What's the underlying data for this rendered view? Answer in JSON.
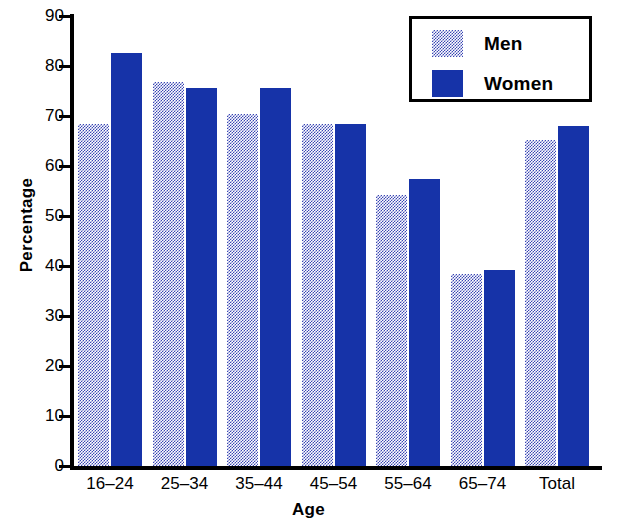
{
  "chart_data": {
    "type": "bar",
    "title": "",
    "xlabel": "Age",
    "ylabel": "Percentage",
    "categories": [
      "16–24",
      "25–34",
      "35–44",
      "45–54",
      "55–64",
      "65–74",
      "Total"
    ],
    "series": [
      {
        "name": "Men",
        "color": "#3a46b4",
        "fill": "dotted-checker",
        "values": [
          68.5,
          76.8,
          70.5,
          68.4,
          54.3,
          38.4,
          65.2
        ]
      },
      {
        "name": "Women",
        "color": "#1633a8",
        "fill": "solid",
        "values": [
          82.7,
          75.7,
          75.6,
          68.4,
          57.4,
          39.3,
          68.1
        ]
      }
    ],
    "ylim": [
      0,
      90
    ],
    "yticks": [
      0,
      10,
      20,
      30,
      40,
      50,
      60,
      70,
      80,
      90
    ],
    "ytick_labels": [
      "0",
      "10",
      "20",
      "30",
      "40",
      "50",
      "60",
      "70",
      "80",
      "90"
    ],
    "grid": false,
    "legend_position": "top-right",
    "legend_entries": [
      "Men",
      "Women"
    ]
  },
  "axes": {
    "y_title": "Percentage",
    "x_title": "Age"
  },
  "legend": {
    "men_label": "Men",
    "women_label": "Women"
  }
}
